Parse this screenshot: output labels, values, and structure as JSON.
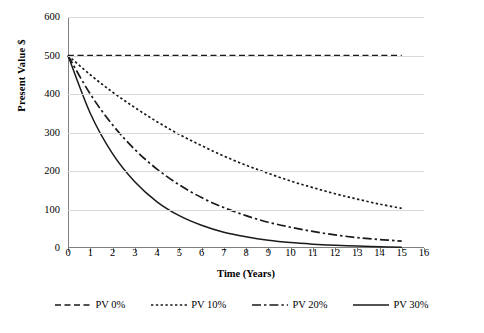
{
  "chart_data": {
    "type": "line",
    "title": "",
    "xlabel": "Time (Years)",
    "ylabel": "Present Value $",
    "xlim": [
      0,
      16
    ],
    "ylim": [
      0,
      600
    ],
    "xticks": [
      "0",
      "1",
      "2",
      "3",
      "4",
      "5",
      "6",
      "7",
      "8",
      "9",
      "10",
      "11",
      "12",
      "13",
      "14",
      "15",
      "16"
    ],
    "yticks": [
      "0",
      "100",
      "200",
      "300",
      "400",
      "500",
      "600"
    ],
    "grid": "horizontal",
    "legend_position": "bottom",
    "x": [
      0,
      1,
      2,
      3,
      4,
      5,
      6,
      7,
      8,
      9,
      10,
      11,
      12,
      13,
      14,
      15
    ],
    "series": [
      {
        "name": "PV 0%",
        "rate": 0.0,
        "line_style": "dashed",
        "color": "#1a1a1a",
        "values": [
          500,
          500,
          500,
          500,
          500,
          500,
          500,
          500,
          500,
          500,
          500,
          500,
          500,
          500,
          500,
          500
        ]
      },
      {
        "name": "PV 10%",
        "rate": 0.1,
        "line_style": "dotted",
        "color": "#1a1a1a",
        "values": [
          500,
          450,
          405,
          365,
          328,
          295,
          266,
          239,
          215,
          194,
          174,
          157,
          141,
          127,
          114,
          103
        ]
      },
      {
        "name": "PV 20%",
        "rate": 0.2,
        "line_style": "dash-dot",
        "color": "#1a1a1a",
        "values": [
          500,
          400,
          320,
          256,
          205,
          164,
          131,
          105,
          84,
          67,
          54,
          43,
          34,
          27,
          22,
          18
        ]
      },
      {
        "name": "PV 30%",
        "rate": 0.3,
        "line_style": "solid",
        "color": "#1a1a1a",
        "values": [
          500,
          350,
          245,
          172,
          120,
          84,
          59,
          41,
          29,
          20,
          14,
          10,
          7,
          5,
          3,
          2
        ]
      }
    ]
  },
  "axis": {
    "y_title": "Present Value $",
    "x_title": "Time (Years)"
  },
  "legend": {
    "items": [
      {
        "label": "PV 0%"
      },
      {
        "label": "PV 10%"
      },
      {
        "label": "PV 20%"
      },
      {
        "label": "PV 30%"
      }
    ]
  }
}
